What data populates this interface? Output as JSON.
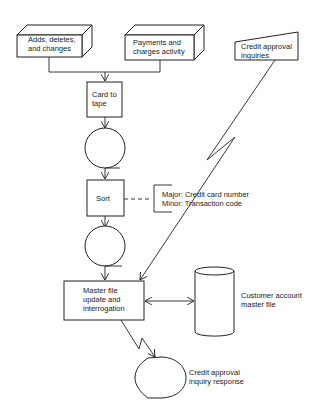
{
  "diagram": {
    "type": "system flowchart",
    "nodes": {
      "adds": {
        "shape": "offline-storage-card-deck",
        "lines": [
          "Adds, deletes,",
          "and changes"
        ]
      },
      "payments": {
        "shape": "offline-storage-card-deck",
        "lines": [
          "Payments and",
          "charges activity"
        ]
      },
      "inquiries": {
        "shape": "manual-input",
        "lines": [
          "Credit approval",
          "inquiries"
        ]
      },
      "card_to_tape": {
        "shape": "process",
        "lines": [
          "Card to",
          "tape"
        ]
      },
      "tape1": {
        "shape": "magnetic-tape",
        "lines": []
      },
      "sort": {
        "shape": "process",
        "lines": [
          "Sort"
        ]
      },
      "sort_note": {
        "shape": "annotation",
        "lines": [
          "Major: Credit card number",
          "Minor: Transaction code"
        ]
      },
      "tape2": {
        "shape": "magnetic-tape",
        "lines": []
      },
      "master_update": {
        "shape": "process",
        "lines": [
          "Master file",
          "update and",
          "interrogation"
        ]
      },
      "master_file": {
        "shape": "disk-storage",
        "lines": [
          "Customer account",
          "master file"
        ]
      },
      "response": {
        "shape": "display",
        "lines": [
          "Credit approval",
          "inquiry response"
        ]
      }
    },
    "edges": [
      {
        "from": "adds",
        "to": "card_to_tape",
        "style": "solid"
      },
      {
        "from": "payments",
        "to": "card_to_tape",
        "style": "solid"
      },
      {
        "from": "card_to_tape",
        "to": "tape1",
        "style": "solid"
      },
      {
        "from": "tape1",
        "to": "sort",
        "style": "solid"
      },
      {
        "from": "sort",
        "to": "sort_note",
        "style": "dashed"
      },
      {
        "from": "sort",
        "to": "tape2",
        "style": "solid"
      },
      {
        "from": "tape2",
        "to": "master_update",
        "style": "solid"
      },
      {
        "from": "inquiries",
        "to": "master_update",
        "style": "communication-link"
      },
      {
        "from": "master_update",
        "to": "master_file",
        "style": "bidirectional"
      },
      {
        "from": "master_update",
        "to": "response",
        "style": "communication-link"
      }
    ]
  }
}
